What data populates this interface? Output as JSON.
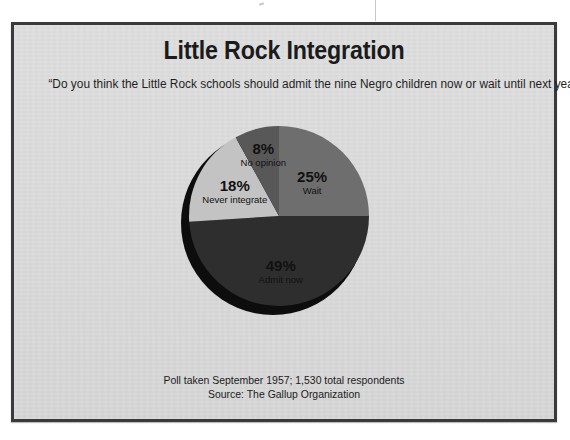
{
  "page": {
    "background_color": "#ffffff",
    "frame_background": "#dcdcdc",
    "frame_border_color": "#3a3a3c"
  },
  "chart_data": {
    "type": "pie",
    "title": "Little Rock Integration",
    "subtitle": "“Do you think the Little Rock schools should admit the nine Negro children now or wait until next year?”",
    "categories": [
      "Wait",
      "Admit now",
      "Never integrate",
      "No opinion"
    ],
    "values": [
      25,
      49,
      18,
      8
    ],
    "value_labels": [
      "25%",
      "49%",
      "18%",
      "8%"
    ],
    "colors": [
      "#6e6e6e",
      "#2e2e2e",
      "#c3c3c3",
      "#585858"
    ],
    "units": "percent",
    "start_angle_deg": 0,
    "direction": "clockwise",
    "depth_shadow_color": "#0d0d0d",
    "legend": "none",
    "grid": false,
    "slices": [
      {
        "label": "Wait",
        "value": 25,
        "display": "25%",
        "color": "#6e6e6e",
        "label_fill": "#111111"
      },
      {
        "label": "Admit now",
        "value": 49,
        "display": "49%",
        "color": "#2e2e2e",
        "label_fill": "#111111"
      },
      {
        "label": "Never integrate",
        "value": 18,
        "display": "18%",
        "color": "#c3c3c3",
        "label_fill": "#111111"
      },
      {
        "label": "No opinion",
        "value": 8,
        "display": "8%",
        "color": "#585858",
        "label_fill": "#111111"
      }
    ],
    "footnotes": [
      "Poll taken September 1957; 1,530 total respondents",
      "Source: The Gallup Organization"
    ]
  },
  "footer": {
    "line1": "Poll taken September 1957; 1,530 total respondents",
    "line2": "Source: The Gallup Organization"
  }
}
